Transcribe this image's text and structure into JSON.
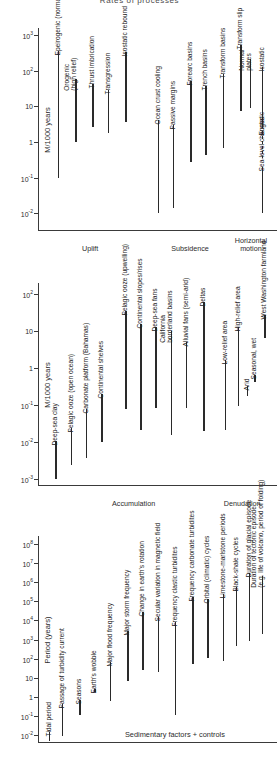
{
  "figure": {
    "title": "Rates of processes"
  },
  "chart_data": {
    "type": "bar",
    "title": "Rates of processes",
    "orientation": "vertical-log-ranges",
    "panels": [
      {
        "id": "panel-uplift-subsidence",
        "ylabel": "M/1000 years",
        "ylim": [
          -2.5,
          3.2
        ],
        "ticks": [
          {
            "value": 3,
            "label": "10",
            "exp": "3"
          },
          {
            "value": 2,
            "label": "10",
            "exp": "2"
          },
          {
            "value": 1,
            "label": "10",
            "exp": ""
          },
          {
            "value": 0,
            "label": "1",
            "exp": ""
          },
          {
            "value": -1,
            "label": "10",
            "exp": "-1"
          },
          {
            "value": -2,
            "label": "10",
            "exp": "-2"
          }
        ],
        "bars": [
          {
            "label": "Epeirogenic (normal relief)",
            "x": 9,
            "low": -1.0,
            "high": 2.55,
            "dashed": false
          },
          {
            "label": "Orogenic\n(high relief)",
            "x": 17,
            "low": 0.0,
            "high": 1.78,
            "dashed": false
          },
          {
            "label": "Thrust imbrication",
            "x": 25,
            "low": 0.42,
            "high": 1.62,
            "dashed": false
          },
          {
            "label": "Transgression",
            "x": 32,
            "low": 0.26,
            "high": 1.45,
            "dashed": false
          },
          {
            "label": "Isostatic rebound",
            "x": 40,
            "low": 0.56,
            "high": 2.52,
            "dashed": false
          },
          {
            "label": "Ocean crust cooling",
            "x": 55,
            "low": -2.0,
            "high": 0.62,
            "dashed": false
          },
          {
            "label": "Passive margins",
            "x": 62,
            "low": -1.85,
            "high": 0.48,
            "dashed": false
          },
          {
            "label": "Forearc basins",
            "x": 70,
            "low": -0.55,
            "high": 1.72,
            "dashed": false
          },
          {
            "label": "Trench basins",
            "x": 77,
            "low": -0.38,
            "high": 1.58,
            "dashed": false
          },
          {
            "label": "Transform basins",
            "x": 85,
            "low": -0.18,
            "high": 1.92,
            "dashed": false
          },
          {
            "label": "Transform slip",
            "x": 93,
            "low": 0.88,
            "high": 2.72,
            "dashed": false
          },
          {
            "label": "Normal\nplates",
            "x": 97.5,
            "low": 0.95,
            "high": 2.32,
            "dashed": false
          },
          {
            "label": "Isostatic",
            "x": 103,
            "low": 0.4,
            "high": 2.1,
            "dashed": false
          },
          {
            "label": "Eustatic",
            "x": 103,
            "low": -0.45,
            "high": 0.3,
            "dashed": true
          },
          {
            "label": "Sea-level changes",
            "x": 103,
            "low": -2.0,
            "high": -0.7,
            "dashed": false
          }
        ],
        "group_labels": [
          {
            "text": "Uplift",
            "x": 24
          },
          {
            "text": "Subsidence",
            "x": 70
          },
          {
            "text": "Horizontal\nmotion",
            "x": 98
          }
        ]
      },
      {
        "id": "panel-accumulation-denudation",
        "ylabel": "M/1000 years",
        "ylim": [
          -3.2,
          2.3
        ],
        "ticks": [
          {
            "value": 2,
            "label": "10",
            "exp": "2"
          },
          {
            "value": 1,
            "label": "10",
            "exp": ""
          },
          {
            "value": 0,
            "label": "1",
            "exp": ""
          },
          {
            "value": -1,
            "label": "10",
            "exp": "-1"
          },
          {
            "value": -2,
            "label": "10",
            "exp": "-2"
          },
          {
            "value": -3,
            "label": "10",
            "exp": "-3"
          }
        ],
        "bars": [
          {
            "label": "Deep-sea clay",
            "x": 8,
            "low": -3.0,
            "high": -1.98,
            "dashed": false
          },
          {
            "label": "Pelagic ooze (open ocean)",
            "x": 15,
            "low": -2.62,
            "high": -1.62,
            "dashed": false
          },
          {
            "label": "Carbonate platform (Bahamas)",
            "x": 22,
            "low": -2.45,
            "high": -1.12,
            "dashed": false
          },
          {
            "label": "Continental shelves",
            "x": 29,
            "low": -2.02,
            "high": -0.72,
            "dashed": false
          },
          {
            "label": "Pelagic ooze (upwelling)",
            "x": 40,
            "low": -1.12,
            "high": 1.55,
            "dashed": false
          },
          {
            "label": "Continental slopes/rises",
            "x": 47,
            "low": -1.68,
            "high": 1.18,
            "dashed": false
          },
          {
            "label": "Deep-sea fans",
            "x": 54,
            "low": -1.1,
            "high": 1.12,
            "dashed": false
          },
          {
            "label": "California\nborderland basins",
            "x": 61,
            "low": -1.82,
            "high": 1.0,
            "dashed": false
          },
          {
            "label": "Alluvial fans (semi-arid)",
            "x": 68,
            "low": -1.08,
            "high": 0.7,
            "dashed": false
          },
          {
            "label": "Deltas",
            "x": 76,
            "low": -1.72,
            "high": 1.78,
            "dashed": false
          },
          {
            "label": "Low-relief area",
            "x": 86,
            "low": -1.68,
            "high": 0.22,
            "dashed": false
          },
          {
            "label": "High-relief area",
            "x": 92,
            "low": -1.02,
            "high": 1.12,
            "dashed": false
          },
          {
            "label": "Arid",
            "x": 96,
            "low": -0.75,
            "high": -0.48,
            "dashed": false
          },
          {
            "label": "Seasonal, wet",
            "x": 99.5,
            "low": -0.38,
            "high": -0.18,
            "dashed": false
          },
          {
            "label": "West Washington farmland",
            "x": 104,
            "low": 0.82,
            "high": 1.42,
            "dashed": false
          }
        ],
        "group_labels": [
          {
            "text": "Accumulation",
            "x": 44
          },
          {
            "text": "Denudation",
            "x": 94
          }
        ]
      },
      {
        "id": "panel-period",
        "ylabel": "Period (years)",
        "ylim": [
          -2.4,
          8.4
        ],
        "ticks": [
          {
            "value": 8,
            "label": "10",
            "exp": "8"
          },
          {
            "value": 7,
            "label": "10",
            "exp": "7"
          },
          {
            "value": 6,
            "label": "10",
            "exp": "6"
          },
          {
            "value": 5,
            "label": "10",
            "exp": "5"
          },
          {
            "value": 4,
            "label": "10",
            "exp": "4"
          },
          {
            "value": 3,
            "label": "10",
            "exp": "3"
          },
          {
            "value": 2,
            "label": "10",
            "exp": "2"
          },
          {
            "value": 1,
            "label": "10",
            "exp": ""
          },
          {
            "value": 0,
            "label": "1",
            "exp": ""
          },
          {
            "value": -1,
            "label": "10",
            "exp": "-1"
          },
          {
            "value": -2,
            "label": "10",
            "exp": "-2"
          }
        ],
        "bars": [
          {
            "label": "Tidal period",
            "x": 5,
            "low": -2.3,
            "high": -1.85,
            "dashed": false
          },
          {
            "label": "Passage of turbidity current",
            "x": 11,
            "low": -2.05,
            "high": -0.35,
            "dashed": false
          },
          {
            "label": "Seasons",
            "x": 19,
            "low": -0.95,
            "high": -0.15,
            "dashed": false
          },
          {
            "label": "Earth's wobble",
            "x": 26,
            "low": 0.25,
            "high": 0.42,
            "dashed": false
          },
          {
            "label": "Major flood frequency",
            "x": 33,
            "low": -0.2,
            "high": 1.85,
            "dashed": false
          },
          {
            "label": "Major storm frequency",
            "x": 41,
            "low": 0.85,
            "high": 3.45,
            "dashed": false
          },
          {
            "label": "Change in earth's rotation",
            "x": 48,
            "low": 1.42,
            "high": 4.45,
            "dashed": false
          },
          {
            "label": "Secular variation in magnetic field",
            "x": 55,
            "low": 1.32,
            "high": 4.15,
            "dashed": false
          },
          {
            "label": "Frequency clastic turbidites",
            "x": 63,
            "low": -0.95,
            "high": 3.9,
            "dashed": false
          },
          {
            "label": "Frequency carbonate turbidites",
            "x": 71,
            "low": 1.72,
            "high": 5.2,
            "dashed": false
          },
          {
            "label": "Orbital (climatic) cycles",
            "x": 78,
            "low": 2.05,
            "high": 5.1,
            "dashed": false
          },
          {
            "label": "Limestone-marlstone periods",
            "x": 85,
            "low": 1.88,
            "high": 5.38,
            "dashed": false
          },
          {
            "label": "Black-shale cycles",
            "x": 91,
            "low": 2.68,
            "high": 5.72,
            "dashed": false
          },
          {
            "label": "Duration of glacial episode",
            "x": 97,
            "low": 2.92,
            "high": 6.45,
            "dashed": false
          },
          {
            "label": "Duration of tectonic episode\n(e.g. life of volcano, period of folding)",
            "x": 103,
            "low": 3.3,
            "high": 6.3,
            "dashed": false
          }
        ],
        "group_labels": [],
        "footer_label": {
          "text": "Sedimentary factors + controls",
          "x": 40
        }
      }
    ]
  },
  "colors": {
    "bar": "#2a2a2a",
    "axis": "#3a3a3a",
    "text": "#232323",
    "background": "#ffffff"
  }
}
